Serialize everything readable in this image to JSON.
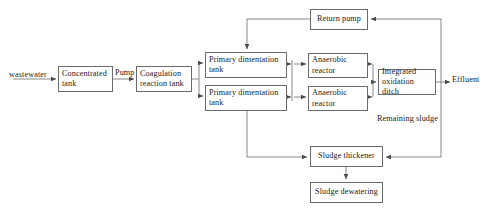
{
  "diagram": {
    "line_color": "#6b6b6b",
    "text_color": "#1b1b1b",
    "background": "#ffffff",
    "nodes": [
      {
        "id": "concentrated_tank",
        "label": "Concentrated tank",
        "x": 58,
        "y": 66,
        "w": 55,
        "h": 26
      },
      {
        "id": "coagulation_tank",
        "label": "Coagulation reaction tank",
        "x": 136,
        "y": 66,
        "w": 56,
        "h": 26
      },
      {
        "id": "primary_tank_1",
        "label": "Primary dimentation tank",
        "x": 205,
        "y": 52,
        "w": 82,
        "h": 26
      },
      {
        "id": "primary_tank_2",
        "label": "Primary dimentation tank",
        "x": 205,
        "y": 85,
        "w": 82,
        "h": 26
      },
      {
        "id": "anaerobic_reactor_1",
        "label": "Anaerobic reactor",
        "x": 308,
        "y": 53,
        "w": 60,
        "h": 25
      },
      {
        "id": "anaerobic_reactor_2",
        "label": "Anaerobic reactor",
        "x": 308,
        "y": 86,
        "w": 60,
        "h": 25
      },
      {
        "id": "oxidation_ditch",
        "label": "Integrated oxidation ditch",
        "x": 378,
        "y": 69,
        "w": 58,
        "h": 26
      },
      {
        "id": "return_pump",
        "label": "Return pump",
        "x": 310,
        "y": 9,
        "w": 58,
        "h": 21
      },
      {
        "id": "sludge_thickener",
        "label": "Sludge thickener",
        "x": 310,
        "y": 146,
        "w": 73,
        "h": 21
      },
      {
        "id": "sludge_dewatering",
        "label": "Sludge dewatering",
        "x": 310,
        "y": 182,
        "w": 73,
        "h": 21
      }
    ],
    "labels": [
      {
        "id": "inlet_label",
        "text": "wastewater",
        "x": 9,
        "y": 70
      },
      {
        "id": "pump_label",
        "text": "Pump",
        "x": 115,
        "y": 68
      },
      {
        "id": "effluent_label",
        "text": "Effluent",
        "x": 452,
        "y": 75
      },
      {
        "id": "remaining_sludge_label",
        "text": "Remaining sludge",
        "x": 377,
        "y": 114
      }
    ]
  }
}
